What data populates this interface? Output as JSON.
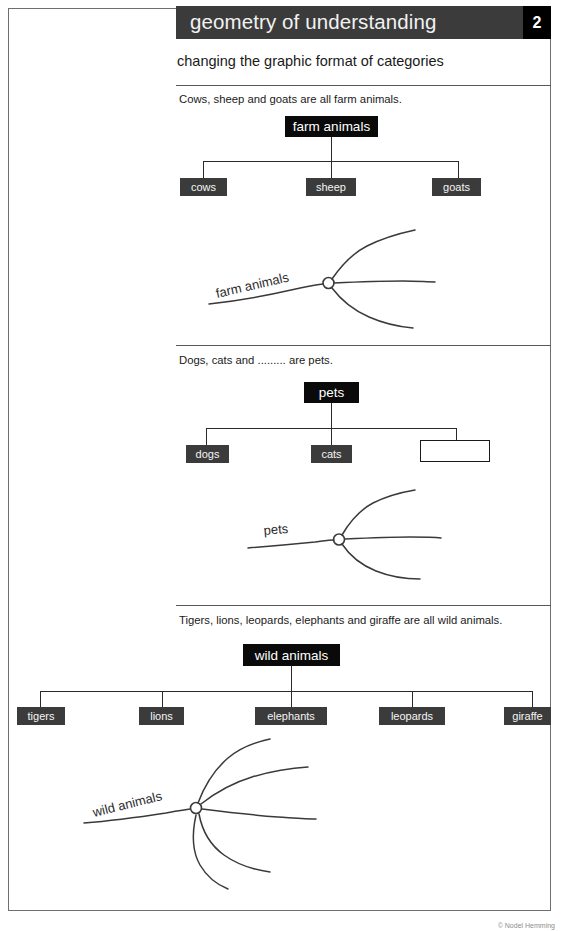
{
  "header": {
    "title": "geometry of understanding",
    "number": "2",
    "subtitle": "changing the graphic format of categories",
    "bar_color": "#3b3b3b",
    "number_box_color": "#000000"
  },
  "footer": {
    "credit": "© Nodel Hemming"
  },
  "sections": [
    {
      "id": "farm-animals",
      "prompt": "Cows, sheep and goats are all farm animals.",
      "tree": {
        "root": "farm animals",
        "children": [
          "cows",
          "sheep",
          "goats"
        ]
      },
      "sketch": {
        "label": "farm animals",
        "branches": 3
      }
    },
    {
      "id": "pets",
      "prompt": "Dogs, cats and ......... are pets.",
      "tree": {
        "root": "pets",
        "children": [
          "dogs",
          "cats",
          ""
        ]
      },
      "sketch": {
        "label": "pets",
        "branches": 3
      }
    },
    {
      "id": "wild-animals",
      "prompt": "Tigers, lions, leopards, elephants and giraffe are all wild animals.",
      "tree": {
        "root": "wild animals",
        "children": [
          "tigers",
          "lions",
          "elephants",
          "leopards",
          "giraffe"
        ]
      },
      "sketch": {
        "label": "wild animals",
        "branches": 5
      }
    }
  ],
  "colors": {
    "box_fill": "#3b3b3b",
    "root_fill": "#0a0a0a",
    "text_on_dark": "#f4f4f4",
    "rule": "#58585a",
    "frame": "#6d6f71",
    "sketch_ink": "#3a3a3a"
  }
}
